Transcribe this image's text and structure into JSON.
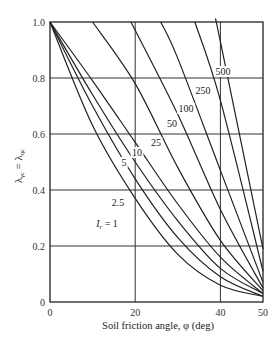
{
  "chart_data": {
    "type": "line",
    "title": "",
    "xlabel": "Soil friction angle, φ (deg)",
    "ylabel": "λγc = λqc",
    "xlim": [
      0,
      50
    ],
    "ylim": [
      0,
      1.0
    ],
    "x_ticks": [
      "0",
      "20",
      "40",
      "50"
    ],
    "y_ticks": [
      "0",
      "0.2",
      "0.4",
      "0.6",
      "0.8",
      "1.0"
    ],
    "grid": {
      "x": [
        20,
        40
      ],
      "y": [
        0.2,
        0.4,
        0.6,
        0.8
      ]
    },
    "legend": "inline curve labels",
    "series": [
      {
        "name": "Ir = 1",
        "label": "Ir = 1",
        "points": [
          [
            0,
            1.0
          ],
          [
            10,
            0.63
          ],
          [
            20,
            0.37
          ],
          [
            30,
            0.17
          ],
          [
            40,
            0.06
          ],
          [
            50,
            0.02
          ]
        ]
      },
      {
        "name": "Ir = 2.5",
        "label": "2.5",
        "points": [
          [
            0,
            1.0
          ],
          [
            10,
            0.7
          ],
          [
            20,
            0.44
          ],
          [
            30,
            0.23
          ],
          [
            40,
            0.09
          ],
          [
            50,
            0.02
          ]
        ]
      },
      {
        "name": "Ir = 5",
        "label": "5",
        "points": [
          [
            0,
            1.0
          ],
          [
            10,
            0.74
          ],
          [
            20,
            0.5
          ],
          [
            30,
            0.29
          ],
          [
            40,
            0.12
          ],
          [
            50,
            0.03
          ]
        ]
      },
      {
        "name": "Ir = 10",
        "label": "10",
        "points": [
          [
            0,
            1.0
          ],
          [
            10,
            0.79
          ],
          [
            20,
            0.57
          ],
          [
            30,
            0.35
          ],
          [
            40,
            0.16
          ],
          [
            50,
            0.03
          ]
        ]
      },
      {
        "name": "Ir = 25",
        "label": "25",
        "points": [
          [
            10,
            1.0
          ],
          [
            20,
            0.78
          ],
          [
            30,
            0.48
          ],
          [
            40,
            0.22
          ],
          [
            50,
            0.04
          ]
        ]
      },
      {
        "name": "Ir = 50",
        "label": "50",
        "points": [
          [
            19,
            1.0
          ],
          [
            30,
            0.67
          ],
          [
            40,
            0.33
          ],
          [
            50,
            0.05
          ]
        ]
      },
      {
        "name": "Ir = 100",
        "label": "100",
        "points": [
          [
            26,
            1.0
          ],
          [
            30,
            0.87
          ],
          [
            40,
            0.47
          ],
          [
            50,
            0.07
          ]
        ]
      },
      {
        "name": "Ir = 250",
        "label": "250",
        "points": [
          [
            34,
            1.0
          ],
          [
            40,
            0.72
          ],
          [
            50,
            0.11
          ]
        ]
      },
      {
        "name": "Ir = 500",
        "label": "500",
        "points": [
          [
            39,
            1.0
          ],
          [
            40,
            0.93
          ],
          [
            50,
            0.19
          ]
        ]
      }
    ],
    "label_positions": [
      {
        "text": "I",
        "sub": "r",
        "rest": " = 1",
        "x": 107,
        "y": 227
      },
      {
        "text": "2.5",
        "x": 118,
        "y": 206
      },
      {
        "text": "5",
        "x": 124,
        "y": 166
      },
      {
        "text": "10",
        "x": 137,
        "y": 156
      },
      {
        "text": "25",
        "x": 156,
        "y": 146
      },
      {
        "text": "50",
        "x": 172,
        "y": 127
      },
      {
        "text": "100",
        "x": 186,
        "y": 112
      },
      {
        "text": "250",
        "x": 203,
        "y": 94
      },
      {
        "text": "500",
        "x": 223,
        "y": 75
      }
    ],
    "color": "#222222"
  }
}
